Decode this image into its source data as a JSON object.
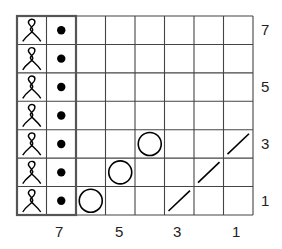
{
  "chart_data": {
    "type": "table",
    "columns": 8,
    "rows": 7,
    "row_labels": [
      {
        "row": 1,
        "label": "1"
      },
      {
        "row": 3,
        "label": "3"
      },
      {
        "row": 5,
        "label": "5"
      },
      {
        "row": 7,
        "label": "7"
      }
    ],
    "column_labels": [
      {
        "col": 1,
        "label": "1"
      },
      {
        "col": 3,
        "label": "3"
      },
      {
        "col": 5,
        "label": "5"
      },
      {
        "col": 7,
        "label": "7"
      }
    ],
    "repeat_box": {
      "columns": [
        7,
        8
      ],
      "rows": [
        1,
        7
      ]
    },
    "cells": [
      {
        "row": 1,
        "col": 8,
        "symbol": "twisted-loop"
      },
      {
        "row": 2,
        "col": 8,
        "symbol": "twisted-loop"
      },
      {
        "row": 3,
        "col": 8,
        "symbol": "twisted-loop"
      },
      {
        "row": 4,
        "col": 8,
        "symbol": "twisted-loop"
      },
      {
        "row": 5,
        "col": 8,
        "symbol": "twisted-loop"
      },
      {
        "row": 6,
        "col": 8,
        "symbol": "twisted-loop"
      },
      {
        "row": 7,
        "col": 8,
        "symbol": "twisted-loop"
      },
      {
        "row": 1,
        "col": 7,
        "symbol": "dot"
      },
      {
        "row": 2,
        "col": 7,
        "symbol": "dot"
      },
      {
        "row": 3,
        "col": 7,
        "symbol": "dot"
      },
      {
        "row": 4,
        "col": 7,
        "symbol": "dot"
      },
      {
        "row": 5,
        "col": 7,
        "symbol": "dot"
      },
      {
        "row": 6,
        "col": 7,
        "symbol": "dot"
      },
      {
        "row": 7,
        "col": 7,
        "symbol": "dot"
      },
      {
        "row": 1,
        "col": 6,
        "symbol": "circle"
      },
      {
        "row": 2,
        "col": 5,
        "symbol": "circle"
      },
      {
        "row": 3,
        "col": 4,
        "symbol": "circle"
      },
      {
        "row": 1,
        "col": 3,
        "symbol": "slash"
      },
      {
        "row": 2,
        "col": 2,
        "symbol": "slash"
      },
      {
        "row": 3,
        "col": 1,
        "symbol": "slash"
      }
    ]
  },
  "labels": {
    "right": [
      "7",
      "5",
      "3",
      "1"
    ],
    "bottom": [
      "7",
      "5",
      "3",
      "1"
    ]
  }
}
